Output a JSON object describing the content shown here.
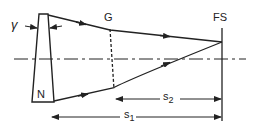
{
  "diagram": {
    "type": "optical ray diagram",
    "labels": {
      "angle": "γ",
      "prism": "N",
      "grating": "G",
      "field_stop": "FS",
      "distance_2_base": "s",
      "distance_2_sub": "2",
      "distance_1_base": "s",
      "distance_1_sub": "1"
    },
    "colors": {
      "stroke": "#222222",
      "background": "#ffffff"
    }
  }
}
